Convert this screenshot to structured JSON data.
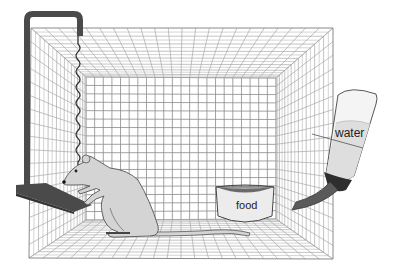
{
  "diagram": {
    "labels": {
      "water": "water",
      "food": "food"
    },
    "elements": [
      {
        "name": "wire-cage",
        "description": "wire mesh cage drawn in one-point perspective"
      },
      {
        "name": "lever-hanger",
        "description": "dark bar hanging from top-left of cage"
      },
      {
        "name": "coiled-cable",
        "description": "coiled wire descending to rat's head"
      },
      {
        "name": "response-lever",
        "description": "dark lever slab at left wall pressed by rat"
      },
      {
        "name": "rat",
        "description": "light gray rat standing on hind legs"
      },
      {
        "name": "food-bowl",
        "description": "bowl labeled food on cage floor"
      },
      {
        "name": "water-bottle",
        "description": "tilted bottle labeled water with spout into cage"
      }
    ],
    "colors": {
      "grid": "#8a8a8a",
      "grid_light": "#a8a8a8",
      "dark_bar": "#4a4a4a",
      "rat_fill": "#d4d4d4",
      "rat_outline": "#555555",
      "bottle_fill": "#f2f2f2",
      "water_fill": "#dcdcdc",
      "spout": "#5a5a5a",
      "bowl_fill": "#ececec",
      "bowl_food": "#6a6a6a"
    }
  }
}
